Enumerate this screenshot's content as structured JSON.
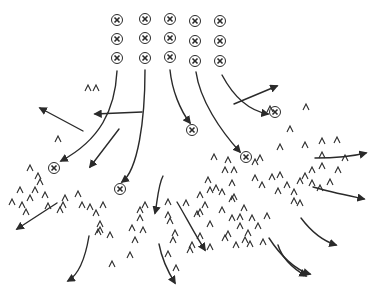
{
  "diagram": {
    "ink_color": "#2a2a2a",
    "background": "#ffffff",
    "x_markers": [
      [
        117,
        20
      ],
      [
        145,
        19
      ],
      [
        170,
        19
      ],
      [
        195,
        21
      ],
      [
        220,
        21
      ],
      [
        117,
        39
      ],
      [
        145,
        38
      ],
      [
        170,
        38
      ],
      [
        195,
        41
      ],
      [
        220,
        41
      ],
      [
        117,
        58
      ],
      [
        145,
        58
      ],
      [
        170,
        57
      ],
      [
        195,
        61
      ],
      [
        220,
        61
      ],
      [
        192,
        130
      ],
      [
        275,
        112
      ],
      [
        246,
        157
      ],
      [
        54,
        168
      ],
      [
        120,
        189
      ]
    ],
    "caret_glyph": "^",
    "carets": [
      [
        58,
        139
      ],
      [
        88,
        88
      ],
      [
        96,
        88
      ],
      [
        270,
        109
      ],
      [
        306,
        107
      ],
      [
        290,
        129
      ],
      [
        280,
        147
      ],
      [
        305,
        145
      ],
      [
        322,
        141
      ],
      [
        322,
        155
      ],
      [
        337,
        140
      ],
      [
        345,
        158
      ],
      [
        30,
        168
      ],
      [
        38,
        176
      ],
      [
        40,
        182
      ],
      [
        20,
        190
      ],
      [
        35,
        190
      ],
      [
        30,
        198
      ],
      [
        45,
        195
      ],
      [
        12,
        202
      ],
      [
        22,
        205
      ],
      [
        26,
        212
      ],
      [
        48,
        206
      ],
      [
        65,
        198
      ],
      [
        63,
        205
      ],
      [
        60,
        210
      ],
      [
        78,
        194
      ],
      [
        82,
        205
      ],
      [
        90,
        207
      ],
      [
        96,
        213
      ],
      [
        103,
        205
      ],
      [
        98,
        232
      ],
      [
        110,
        235
      ],
      [
        100,
        224
      ],
      [
        100,
        230
      ],
      [
        132,
        228
      ],
      [
        140,
        218
      ],
      [
        143,
        230
      ],
      [
        145,
        205
      ],
      [
        168,
        202
      ],
      [
        168,
        215
      ],
      [
        170,
        221
      ],
      [
        173,
        240
      ],
      [
        168,
        254
      ],
      [
        190,
        250
      ],
      [
        140,
        210
      ],
      [
        135,
        240
      ],
      [
        130,
        255
      ],
      [
        112,
        264
      ],
      [
        176,
        268
      ],
      [
        175,
        233
      ],
      [
        192,
        245
      ],
      [
        200,
        236
      ],
      [
        210,
        247
      ],
      [
        210,
        224
      ],
      [
        228,
        234
      ],
      [
        197,
        214
      ],
      [
        210,
        190
      ],
      [
        200,
        195
      ],
      [
        186,
        203
      ],
      [
        200,
        212
      ],
      [
        232,
        199
      ],
      [
        240,
        217
      ],
      [
        248,
        233
      ],
      [
        250,
        244
      ],
      [
        258,
        226
      ],
      [
        267,
        216
      ],
      [
        255,
        178
      ],
      [
        262,
        185
      ],
      [
        280,
        175
      ],
      [
        278,
        191
      ],
      [
        287,
        185
      ],
      [
        294,
        192
      ],
      [
        300,
        181
      ],
      [
        305,
        176
      ],
      [
        312,
        170
      ],
      [
        312,
        183
      ],
      [
        272,
        177
      ],
      [
        294,
        201
      ],
      [
        300,
        203
      ],
      [
        322,
        166
      ],
      [
        338,
        170
      ],
      [
        330,
        182
      ],
      [
        320,
        188
      ],
      [
        232,
        183
      ],
      [
        234,
        197
      ],
      [
        222,
        210
      ],
      [
        205,
        205
      ],
      [
        225,
        170
      ],
      [
        214,
        157
      ],
      [
        208,
        180
      ],
      [
        216,
        188
      ],
      [
        222,
        192
      ],
      [
        244,
        208
      ],
      [
        232,
        218
      ],
      [
        234,
        170
      ],
      [
        255,
        162
      ],
      [
        260,
        158
      ],
      [
        228,
        160
      ],
      [
        252,
        218
      ],
      [
        225,
        238
      ],
      [
        236,
        245
      ],
      [
        245,
        240
      ],
      [
        263,
        242
      ],
      [
        240,
        226
      ]
    ],
    "curves": [
      {
        "d": "M117,71 C115,110 100,140 61,161",
        "arrow": true
      },
      {
        "d": "M145,70 C145,120 138,170 122,182",
        "arrow": true
      },
      {
        "d": "M170,70 C172,90 180,110 190,123",
        "arrow": true
      },
      {
        "d": "M196,72 C200,100 220,130 240,152",
        "arrow": true
      },
      {
        "d": "M222,75 C230,90 245,110 268,114",
        "arrow": true
      },
      {
        "d": "M142,112 L95,114",
        "arrow": true
      },
      {
        "d": "M83,131 L40,108",
        "arrow": true
      },
      {
        "d": "M119,129 L90,167",
        "arrow": true
      },
      {
        "d": "M234,104 L277,86",
        "arrow": true
      },
      {
        "d": "M315,158 C330,158 350,157 366,153",
        "arrow": true
      },
      {
        "d": "M313,187 C330,192 350,196 364,199",
        "arrow": true
      },
      {
        "d": "M301,218 C310,230 320,240 336,245",
        "arrow": true
      },
      {
        "d": "M269,238 C280,255 295,270 310,274",
        "arrow": true
      },
      {
        "d": "M278,245 C282,258 292,268 306,276",
        "arrow": true
      },
      {
        "d": "M163,176 C158,185 157,205 155,213",
        "arrow": true
      },
      {
        "d": "M57,203 L17,229",
        "arrow": true
      },
      {
        "d": "M89,236 C85,260 78,275 68,281",
        "arrow": true
      },
      {
        "d": "M159,244 C162,260 170,275 175,283",
        "arrow": true
      },
      {
        "d": "M177,202 C185,215 195,235 205,250",
        "arrow": true
      }
    ]
  }
}
